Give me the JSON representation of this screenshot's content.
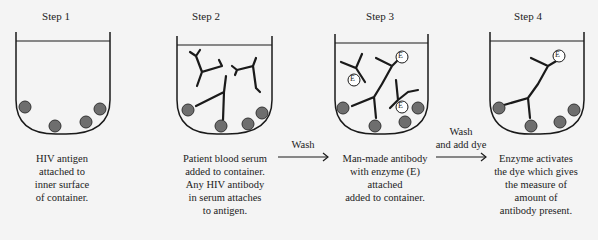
{
  "steps": [
    {
      "title": "Step 1",
      "caption": [
        "HIV antigen",
        "attached to",
        "inner surface",
        "of container."
      ]
    },
    {
      "title": "Step 2",
      "caption": [
        "Patient blood serum",
        "added to container.",
        "Any HIV antibody",
        "in serum attaches",
        "to antigen."
      ]
    },
    {
      "title": "Step 3",
      "caption": [
        "Man-made antibody",
        "with enzyme (E)",
        "attached",
        "added to container."
      ]
    },
    {
      "title": "Step 4",
      "caption": [
        "Enzyme activates",
        "the dye which gives",
        "the measure of",
        "amount of",
        "antibody present."
      ]
    }
  ],
  "arrows": [
    {
      "label": [
        "Wash"
      ]
    },
    {
      "label": [
        "Wash",
        "and add dye"
      ]
    }
  ],
  "enzyme_label": "E",
  "colors": {
    "antigen": "#6e6e6e",
    "line": "#1a1a1a",
    "background": "#f4f4f4"
  }
}
